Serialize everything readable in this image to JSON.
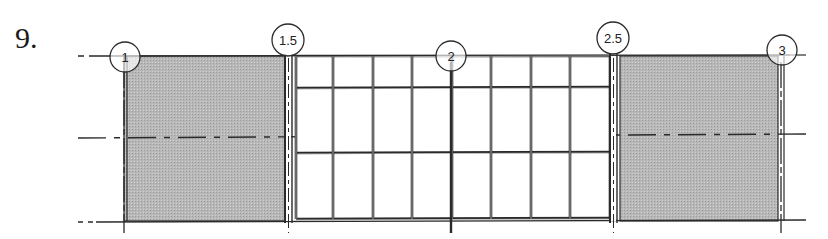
{
  "problem": {
    "number": "9."
  },
  "drawing": {
    "type": "elevation",
    "colors": {
      "line": "#2a2a2a",
      "hatch": "#b3b3b3",
      "background": "#ffffff"
    },
    "grid_bubbles": [
      {
        "label": "1",
        "x": 125,
        "y": 57
      },
      {
        "label": "1.5",
        "x": 288,
        "y": 40
      },
      {
        "label": "2",
        "x": 451,
        "y": 56
      },
      {
        "label": "2.5",
        "x": 613,
        "y": 38
      },
      {
        "label": "3",
        "x": 782,
        "y": 50
      }
    ],
    "levels": [
      {
        "name": "level-top",
        "y": 56
      },
      {
        "name": "level-middle",
        "y": 136
      },
      {
        "name": "level-bottom",
        "y": 221
      }
    ],
    "solid_panels": [
      {
        "name": "left-wall-panel",
        "x1": 124,
        "x2": 285
      },
      {
        "name": "right-wall-panel",
        "x1": 620,
        "x2": 778
      }
    ],
    "curtain_wall": {
      "x1": 296,
      "x2": 610,
      "mullions_x": [
        296,
        333,
        373,
        412,
        452,
        491,
        531,
        570,
        610
      ],
      "transoms_y": [
        56,
        88,
        153,
        219
      ]
    }
  }
}
